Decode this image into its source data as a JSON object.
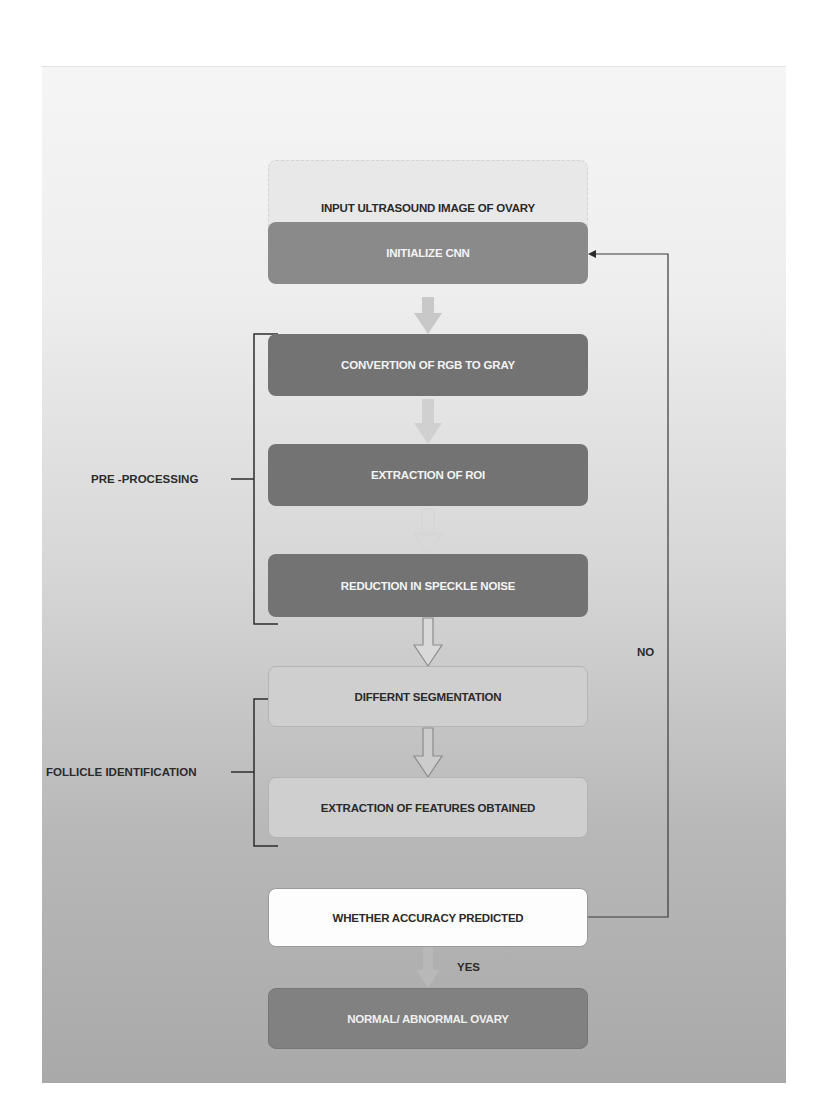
{
  "diagram": {
    "type": "flowchart",
    "nodes": [
      {
        "id": "input",
        "label": "INPUT ULTRASOUND IMAGE OF OVARY",
        "fill": "#e8e8e8"
      },
      {
        "id": "init",
        "label": "INITIALIZE CNN",
        "fill": "#8a8a8a"
      },
      {
        "id": "rgb",
        "label": "CONVERTION OF RGB TO GRAY",
        "fill": "#737373"
      },
      {
        "id": "roi",
        "label": "EXTRACTION OF ROI",
        "fill": "#737373"
      },
      {
        "id": "speckle",
        "label": "REDUCTION IN SPECKLE NOISE",
        "fill": "#737373"
      },
      {
        "id": "seg",
        "label": "DIFFERNT SEGMENTATION",
        "fill": "#cfcfcf"
      },
      {
        "id": "features",
        "label": "EXTRACTION OF FEATURES OBTAINED",
        "fill": "#cfcfcf"
      },
      {
        "id": "decision",
        "label": "WHETHER ACCURACY PREDICTED",
        "fill": "#fdfdfd"
      },
      {
        "id": "output",
        "label": "NORMAL/ ABNORMAL OVARY",
        "fill": "#818181"
      }
    ],
    "edges": [
      {
        "from": "input",
        "to": "init"
      },
      {
        "from": "init",
        "to": "rgb"
      },
      {
        "from": "rgb",
        "to": "roi"
      },
      {
        "from": "roi",
        "to": "speckle"
      },
      {
        "from": "speckle",
        "to": "seg"
      },
      {
        "from": "seg",
        "to": "features"
      },
      {
        "from": "decision",
        "to": "output",
        "label": "YES"
      },
      {
        "from": "decision",
        "to": "init",
        "label": "NO"
      }
    ],
    "groups": [
      {
        "label": "PRE -PROCESSING",
        "members": [
          "rgb",
          "roi",
          "speckle"
        ]
      },
      {
        "label": "FOLLICLE IDENTIFICATION",
        "members": [
          "seg",
          "features"
        ]
      }
    ],
    "edge_labels": {
      "yes": "YES",
      "no": "NO"
    }
  }
}
